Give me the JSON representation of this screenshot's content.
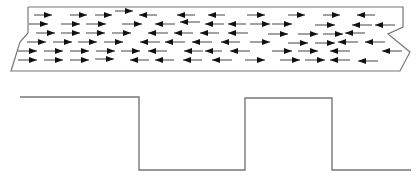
{
  "diagram": {
    "colors": {
      "background": "#ffffff",
      "outline": "#777777",
      "arrow": "#111111",
      "wave": "#777777"
    },
    "sample_outline": [
      [
        28,
        7
      ],
      [
        403,
        7
      ],
      [
        403,
        27
      ],
      [
        388,
        34
      ],
      [
        410,
        52
      ],
      [
        400,
        71
      ],
      [
        11,
        71
      ],
      [
        20,
        42
      ],
      [
        28,
        33
      ],
      [
        28,
        7
      ]
    ],
    "arrows": [
      {
        "dir": "right",
        "x1": 34,
        "x2": 52,
        "y": 15
      },
      {
        "dir": "right",
        "x1": 70,
        "x2": 87,
        "y": 15
      },
      {
        "dir": "right",
        "x1": 95,
        "x2": 112,
        "y": 15
      },
      {
        "dir": "right",
        "x1": 115,
        "x2": 133,
        "y": 11
      },
      {
        "dir": "left",
        "x1": 139,
        "x2": 157,
        "y": 15
      },
      {
        "dir": "left",
        "x1": 177,
        "x2": 195,
        "y": 15
      },
      {
        "dir": "left",
        "x1": 208,
        "x2": 225,
        "y": 15
      },
      {
        "dir": "right",
        "x1": 247,
        "x2": 265,
        "y": 15
      },
      {
        "dir": "right",
        "x1": 288,
        "x2": 305,
        "y": 15
      },
      {
        "dir": "right",
        "x1": 323,
        "x2": 340,
        "y": 15
      },
      {
        "dir": "left",
        "x1": 357,
        "x2": 375,
        "y": 15
      },
      {
        "dir": "right",
        "x1": 29,
        "x2": 48,
        "y": 24
      },
      {
        "dir": "right",
        "x1": 61,
        "x2": 80,
        "y": 24
      },
      {
        "dir": "right",
        "x1": 86,
        "x2": 106,
        "y": 24
      },
      {
        "dir": "right",
        "x1": 122,
        "x2": 142,
        "y": 24
      },
      {
        "dir": "left",
        "x1": 155,
        "x2": 175,
        "y": 24
      },
      {
        "dir": "left",
        "x1": 180,
        "x2": 200,
        "y": 22
      },
      {
        "dir": "left",
        "x1": 205,
        "x2": 224,
        "y": 24
      },
      {
        "dir": "left",
        "x1": 228,
        "x2": 246,
        "y": 24
      },
      {
        "dir": "right",
        "x1": 250,
        "x2": 270,
        "y": 24
      },
      {
        "dir": "right",
        "x1": 272,
        "x2": 292,
        "y": 24
      },
      {
        "dir": "right",
        "x1": 315,
        "x2": 335,
        "y": 25
      },
      {
        "dir": "left",
        "x1": 352,
        "x2": 372,
        "y": 25
      },
      {
        "dir": "left",
        "x1": 375,
        "x2": 395,
        "y": 25
      },
      {
        "dir": "right",
        "x1": 36,
        "x2": 55,
        "y": 33
      },
      {
        "dir": "right",
        "x1": 61,
        "x2": 80,
        "y": 33
      },
      {
        "dir": "right",
        "x1": 86,
        "x2": 105,
        "y": 33
      },
      {
        "dir": "right",
        "x1": 112,
        "x2": 131,
        "y": 33
      },
      {
        "dir": "left",
        "x1": 148,
        "x2": 168,
        "y": 33
      },
      {
        "dir": "left",
        "x1": 174,
        "x2": 193,
        "y": 33
      },
      {
        "dir": "left",
        "x1": 200,
        "x2": 219,
        "y": 33
      },
      {
        "dir": "left",
        "x1": 228,
        "x2": 248,
        "y": 33
      },
      {
        "dir": "right",
        "x1": 268,
        "x2": 288,
        "y": 34
      },
      {
        "dir": "right",
        "x1": 298,
        "x2": 318,
        "y": 34
      },
      {
        "dir": "right",
        "x1": 323,
        "x2": 343,
        "y": 34
      },
      {
        "dir": "left",
        "x1": 345,
        "x2": 365,
        "y": 33
      },
      {
        "dir": "right",
        "x1": 27,
        "x2": 46,
        "y": 42
      },
      {
        "dir": "right",
        "x1": 53,
        "x2": 72,
        "y": 42
      },
      {
        "dir": "right",
        "x1": 78,
        "x2": 97,
        "y": 42
      },
      {
        "dir": "right",
        "x1": 104,
        "x2": 123,
        "y": 42
      },
      {
        "dir": "left",
        "x1": 140,
        "x2": 160,
        "y": 42
      },
      {
        "dir": "left",
        "x1": 165,
        "x2": 185,
        "y": 42
      },
      {
        "dir": "left",
        "x1": 192,
        "x2": 212,
        "y": 42
      },
      {
        "dir": "left",
        "x1": 221,
        "x2": 240,
        "y": 42
      },
      {
        "dir": "right",
        "x1": 250,
        "x2": 270,
        "y": 42
      },
      {
        "dir": "right",
        "x1": 288,
        "x2": 308,
        "y": 43
      },
      {
        "dir": "right",
        "x1": 315,
        "x2": 335,
        "y": 43
      },
      {
        "dir": "left",
        "x1": 338,
        "x2": 358,
        "y": 42
      },
      {
        "dir": "left",
        "x1": 365,
        "x2": 385,
        "y": 42
      },
      {
        "dir": "right",
        "x1": 18,
        "x2": 37,
        "y": 51
      },
      {
        "dir": "right",
        "x1": 44,
        "x2": 63,
        "y": 51
      },
      {
        "dir": "right",
        "x1": 70,
        "x2": 89,
        "y": 51
      },
      {
        "dir": "right",
        "x1": 96,
        "x2": 115,
        "y": 51
      },
      {
        "dir": "right",
        "x1": 121,
        "x2": 140,
        "y": 51
      },
      {
        "dir": "left",
        "x1": 148,
        "x2": 167,
        "y": 51
      },
      {
        "dir": "left",
        "x1": 184,
        "x2": 203,
        "y": 51
      },
      {
        "dir": "left",
        "x1": 205,
        "x2": 222,
        "y": 51
      },
      {
        "dir": "left",
        "x1": 230,
        "x2": 250,
        "y": 51
      },
      {
        "dir": "right",
        "x1": 272,
        "x2": 292,
        "y": 51
      },
      {
        "dir": "right",
        "x1": 298,
        "x2": 318,
        "y": 51
      },
      {
        "dir": "left",
        "x1": 330,
        "x2": 350,
        "y": 51
      },
      {
        "dir": "left",
        "x1": 382,
        "x2": 402,
        "y": 51
      },
      {
        "dir": "right",
        "x1": 18,
        "x2": 37,
        "y": 60
      },
      {
        "dir": "right",
        "x1": 44,
        "x2": 63,
        "y": 60
      },
      {
        "dir": "right",
        "x1": 70,
        "x2": 89,
        "y": 60
      },
      {
        "dir": "right",
        "x1": 95,
        "x2": 114,
        "y": 59
      },
      {
        "dir": "left",
        "x1": 130,
        "x2": 149,
        "y": 60
      },
      {
        "dir": "left",
        "x1": 155,
        "x2": 174,
        "y": 60
      },
      {
        "dir": "left",
        "x1": 183,
        "x2": 202,
        "y": 60
      },
      {
        "dir": "left",
        "x1": 212,
        "x2": 232,
        "y": 60
      },
      {
        "dir": "right",
        "x1": 245,
        "x2": 265,
        "y": 60
      },
      {
        "dir": "right",
        "x1": 280,
        "x2": 300,
        "y": 60
      },
      {
        "dir": "right",
        "x1": 305,
        "x2": 325,
        "y": 60
      },
      {
        "dir": "left",
        "x1": 330,
        "x2": 350,
        "y": 60
      },
      {
        "dir": "left",
        "x1": 358,
        "x2": 378,
        "y": 61
      }
    ],
    "square_wave": [
      [
        20,
        97
      ],
      [
        139,
        97
      ],
      [
        139,
        170
      ],
      [
        245,
        170
      ],
      [
        245,
        98
      ],
      [
        332,
        98
      ],
      [
        332,
        170
      ],
      [
        411,
        170
      ]
    ]
  }
}
